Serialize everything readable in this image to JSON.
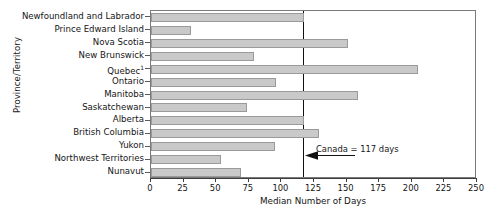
{
  "chart_data": {
    "type": "bar",
    "orientation": "horizontal",
    "title": "",
    "xlabel": "Median Number of Days",
    "ylabel": "Province/Territory",
    "xlim": [
      0,
      250
    ],
    "xticks": [
      0,
      25,
      50,
      75,
      100,
      125,
      150,
      175,
      200,
      225,
      250
    ],
    "grid": false,
    "legend": null,
    "categories": [
      "Newfoundland and Labrador",
      "Prince Edward Island",
      "Nova Scotia",
      "New Brunswick",
      "Quebec",
      "Ontario",
      "Manitoba",
      "Saskatchewan",
      "Alberta",
      "British Columbia",
      "Yukon",
      "Northwest Territories",
      "Nunavut"
    ],
    "category_footnotes": {
      "Quebec": "1"
    },
    "values": [
      117,
      31,
      151,
      79,
      205,
      96,
      159,
      74,
      117,
      129,
      95,
      54,
      69
    ],
    "annotations": [
      {
        "text": "Canada = 117 days",
        "value": 117,
        "type": "reference-line-with-arrow"
      }
    ],
    "colors": {
      "bar_fill": "#c9c9c9",
      "bar_edge": "#9a9a9a",
      "reference_line": "#111111",
      "axis": "#3d3d3d",
      "text": "#151515"
    }
  }
}
